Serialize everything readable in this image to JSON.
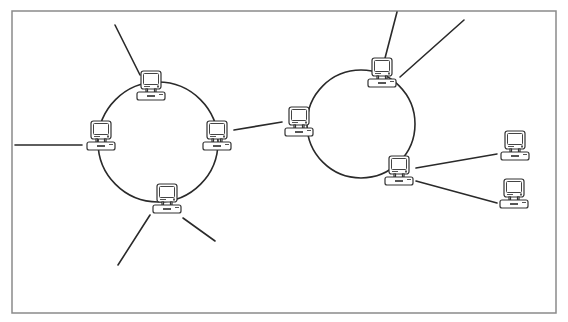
{
  "diagram": {
    "title": "",
    "type": "network topology - two interconnected ring networks",
    "frame": {
      "x": 12,
      "y": 11,
      "width": 544,
      "height": 302,
      "color": "#8a8a8a"
    },
    "line_color": "#2a2a2a",
    "rings": [
      {
        "id": "left-ring",
        "cx": 158,
        "cy": 142,
        "r": 60
      },
      {
        "id": "right-ring",
        "cx": 361,
        "cy": 124,
        "r": 54
      }
    ],
    "nodes": [
      {
        "id": "left-ring-top",
        "x": 150,
        "y": 85,
        "label": ""
      },
      {
        "id": "left-ring-left",
        "x": 100,
        "y": 135,
        "label": ""
      },
      {
        "id": "left-ring-right",
        "x": 216,
        "y": 135,
        "label": ""
      },
      {
        "id": "left-ring-bottom",
        "x": 166,
        "y": 198,
        "label": ""
      },
      {
        "id": "right-ring-left",
        "x": 298,
        "y": 121,
        "label": ""
      },
      {
        "id": "right-ring-top",
        "x": 381,
        "y": 72,
        "label": ""
      },
      {
        "id": "right-ring-bottom",
        "x": 398,
        "y": 170,
        "label": ""
      },
      {
        "id": "satellite-upper",
        "x": 514,
        "y": 145,
        "label": ""
      },
      {
        "id": "satellite-lower",
        "x": 513,
        "y": 193,
        "label": ""
      }
    ],
    "links": [
      {
        "from": "left-ring-top",
        "x1": 140,
        "y1": 75,
        "x2": 115,
        "y2": 25
      },
      {
        "from": "left-ring-left",
        "x1": 82,
        "y1": 145,
        "x2": 15,
        "y2": 145
      },
      {
        "from": "left-ring-bottom",
        "x1": 150,
        "y1": 215,
        "x2": 118,
        "y2": 265
      },
      {
        "from": "left-ring-bottom",
        "x1": 183,
        "y1": 218,
        "x2": 215,
        "y2": 241
      },
      {
        "from": "left-ring-right",
        "x1": 234,
        "y1": 130,
        "x2": 282,
        "y2": 122
      },
      {
        "from": "right-ring-top",
        "x1": 384,
        "y1": 62,
        "x2": 397,
        "y2": 12
      },
      {
        "from": "right-ring-top",
        "x1": 400,
        "y1": 77,
        "x2": 464,
        "y2": 20
      },
      {
        "from": "right-ring-bottom",
        "x1": 416,
        "y1": 168,
        "x2": 497,
        "y2": 154
      },
      {
        "from": "right-ring-bottom",
        "x1": 416,
        "y1": 181,
        "x2": 497,
        "y2": 203
      }
    ],
    "legend": []
  }
}
